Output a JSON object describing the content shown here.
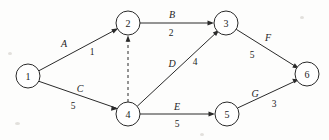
{
  "figure": {
    "type": "activity-on-arrow-network-diagram",
    "background_color": "#fdfdfc",
    "stroke_color": "#2a2a2a"
  },
  "nodes": [
    {
      "id": "1",
      "label": "1",
      "cx": 28,
      "cy": 76,
      "r": 12
    },
    {
      "id": "2",
      "label": "2",
      "cx": 128,
      "cy": 23,
      "r": 12
    },
    {
      "id": "3",
      "label": "3",
      "cx": 226,
      "cy": 23,
      "r": 12
    },
    {
      "id": "4",
      "label": "4",
      "cx": 128,
      "cy": 114,
      "r": 12
    },
    {
      "id": "5",
      "label": "5",
      "cx": 227,
      "cy": 114,
      "r": 12
    },
    {
      "id": "6",
      "label": "6",
      "cx": 307,
      "cy": 74,
      "r": 12
    }
  ],
  "edges": [
    {
      "id": "edge-A",
      "from": "1",
      "to": "2",
      "name": "A",
      "weight": "1",
      "style": "solid",
      "name_x": 64,
      "name_y": 43,
      "weight_x": 92,
      "weight_y": 52
    },
    {
      "id": "edge-C",
      "from": "1",
      "to": "4",
      "name": "C",
      "weight": "5",
      "style": "solid",
      "name_x": 80,
      "name_y": 88,
      "weight_x": 73,
      "weight_y": 106
    },
    {
      "id": "edge-B",
      "from": "2",
      "to": "3",
      "name": "B",
      "weight": "2",
      "style": "solid",
      "name_x": 172,
      "name_y": 14,
      "weight_x": 171,
      "weight_y": 33
    },
    {
      "id": "edge-dummy",
      "from": "4",
      "to": "2",
      "name": "",
      "weight": "",
      "style": "dashed",
      "name_x": 0,
      "name_y": 0,
      "weight_x": 0,
      "weight_y": 0
    },
    {
      "id": "edge-D",
      "from": "4",
      "to": "3",
      "name": "D",
      "weight": "4",
      "style": "solid",
      "name_x": 172,
      "name_y": 63,
      "weight_x": 195,
      "weight_y": 62
    },
    {
      "id": "edge-E",
      "from": "4",
      "to": "5",
      "name": "E",
      "weight": "5",
      "style": "solid",
      "name_x": 177,
      "name_y": 106,
      "weight_x": 177,
      "weight_y": 124
    },
    {
      "id": "edge-F",
      "from": "3",
      "to": "6",
      "name": "F",
      "weight": "5",
      "style": "solid",
      "name_x": 268,
      "name_y": 37,
      "weight_x": 252,
      "weight_y": 55
    },
    {
      "id": "edge-G",
      "from": "5",
      "to": "6",
      "name": "G",
      "weight": "3",
      "style": "solid",
      "name_x": 255,
      "name_y": 93,
      "weight_x": 274,
      "weight_y": 104
    }
  ]
}
